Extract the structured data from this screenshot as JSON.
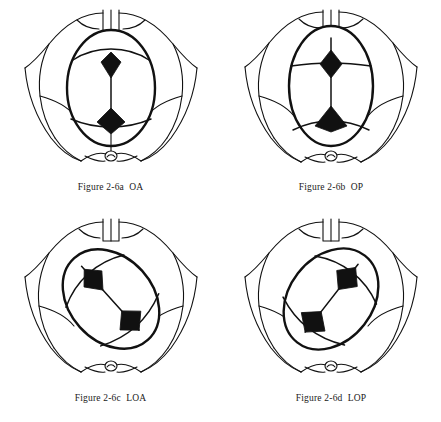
{
  "document": {
    "title": "Figure 2-6 Fetal head positions at the pelvic outlet",
    "background_color": "#ffffff",
    "ink_color": "#111111",
    "panel_count": 4,
    "layout": "2x2 grid"
  },
  "panels": [
    {
      "id": "fig-2-6a",
      "caption": "Figure 2-6a  OA",
      "figure_number": "Figure 2-6a",
      "position_code": "OA",
      "position_name": "Occiput Anterior",
      "skull_rotation_deg": 0,
      "sagittal_suture_orientation": "vertical",
      "anterior_fontanelle_location": "upper-center",
      "posterior_fontanelle_location": "lower-center",
      "landmarks": [
        "pubic symphysis",
        "pubic rami",
        "ischial tuberosity",
        "sacrospinous ligament",
        "coccyx",
        "anus",
        "fetal skull",
        "sagittal suture",
        "coronal suture",
        "lambdoid suture"
      ]
    },
    {
      "id": "fig-2-6b",
      "caption": "Figure 2-6b  OP",
      "figure_number": "Figure 2-6b",
      "position_code": "OP",
      "position_name": "Occiput Posterior",
      "skull_rotation_deg": 0,
      "sagittal_suture_orientation": "vertical",
      "anterior_fontanelle_location": "upper-center",
      "posterior_fontanelle_location": "lower-center",
      "landmarks": [
        "pubic symphysis",
        "pubic rami",
        "ischial tuberosity",
        "sacrospinous ligament",
        "coccyx",
        "anus",
        "fetal skull",
        "sagittal suture",
        "coronal suture",
        "lambdoid suture"
      ]
    },
    {
      "id": "fig-2-6c",
      "caption": "Figure 2-6c  LOA",
      "figure_number": "Figure 2-6c",
      "position_code": "LOA",
      "position_name": "Left Occiput Anterior",
      "skull_rotation_deg": -45,
      "sagittal_suture_orientation": "oblique",
      "anterior_fontanelle_location": "center-left",
      "posterior_fontanelle_location": "upper-right",
      "landmarks": [
        "pubic symphysis",
        "pubic rami",
        "ischial tuberosity",
        "sacrospinous ligament",
        "coccyx",
        "anus",
        "fetal skull",
        "sagittal suture",
        "coronal suture",
        "lambdoid suture"
      ]
    },
    {
      "id": "fig-2-6d",
      "caption": "Figure 2-6d  LOP",
      "figure_number": "Figure 2-6d",
      "position_code": "LOP",
      "position_name": "Left Occiput Posterior",
      "skull_rotation_deg": 45,
      "sagittal_suture_orientation": "oblique",
      "anterior_fontanelle_location": "upper-left",
      "posterior_fontanelle_location": "lower-right",
      "landmarks": [
        "pubic symphysis",
        "pubic rami",
        "ischial tuberosity",
        "sacrospinous ligament",
        "coccyx",
        "anus",
        "fetal skull",
        "sagittal suture",
        "coronal suture",
        "lambdoid suture"
      ]
    }
  ]
}
